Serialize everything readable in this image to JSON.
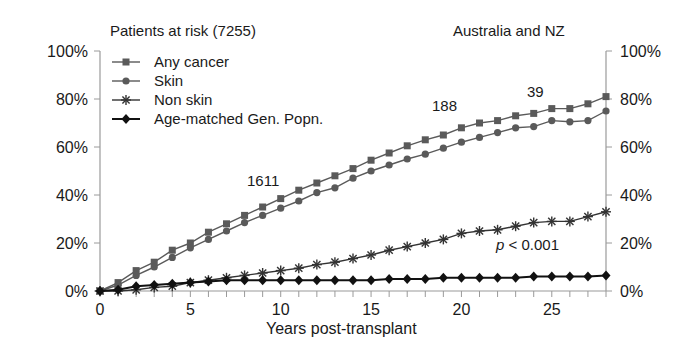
{
  "chart_data": {
    "type": "line",
    "title_left": "Patients at risk (7255)",
    "title_right": "Australia and NZ",
    "xlabel": "Years post-transplant",
    "ylabel": "",
    "xlim": [
      0,
      28
    ],
    "ylim": [
      0,
      100
    ],
    "x_ticks": [
      0,
      5,
      10,
      15,
      20,
      25
    ],
    "y_ticks": [
      "0%",
      "20%",
      "40%",
      "60%",
      "80%",
      "100%"
    ],
    "grid": false,
    "legend_position": "upper-left",
    "x": [
      0,
      1,
      2,
      3,
      4,
      5,
      6,
      7,
      8,
      9,
      10,
      11,
      12,
      13,
      14,
      15,
      16,
      17,
      18,
      19,
      20,
      21,
      22,
      23,
      24,
      25,
      26,
      27,
      28
    ],
    "series": [
      {
        "name": "Any cancer",
        "marker": "square",
        "color": "#5a5a5a",
        "values": [
          0,
          3.5,
          8.5,
          12,
          17,
          20,
          24.5,
          28,
          31.5,
          35,
          38.5,
          42,
          45,
          48,
          51,
          54.5,
          57.5,
          60.5,
          63,
          65,
          68,
          70,
          71,
          73,
          74,
          76,
          76,
          78,
          81
        ]
      },
      {
        "name": "Skin",
        "marker": "circle",
        "color": "#5a5a5a",
        "values": [
          0,
          2.5,
          6.5,
          10,
          14,
          18,
          21.5,
          25,
          28.5,
          31.5,
          34.5,
          37.5,
          41,
          43,
          47,
          50,
          52.5,
          55,
          57,
          59.5,
          62,
          64,
          66,
          68,
          68.5,
          71,
          70.5,
          71,
          75
        ]
      },
      {
        "name": "Non skin",
        "marker": "asterisk",
        "color": "#333333",
        "values": [
          0,
          0,
          0.5,
          1.5,
          2,
          3.5,
          4.5,
          5.5,
          6.5,
          7.5,
          8.5,
          9.5,
          11,
          12,
          13.5,
          15,
          17,
          18.5,
          20,
          21.5,
          24,
          25,
          25.5,
          27,
          28.5,
          29,
          29,
          31,
          33
        ]
      },
      {
        "name": "Age-matched Gen. Popn.",
        "marker": "diamond",
        "color": "#111111",
        "values": [
          0,
          0.5,
          2,
          2.5,
          3,
          3.5,
          4,
          4.5,
          4.5,
          4.5,
          4.5,
          4.5,
          4.5,
          4.5,
          4.5,
          4.5,
          5,
          5,
          5,
          5.5,
          5.5,
          5.5,
          5.5,
          5.5,
          6,
          6,
          6,
          6,
          6.5
        ]
      }
    ],
    "annotations": [
      {
        "text": "1611",
        "x": 9,
        "y": 42
      },
      {
        "text": "188",
        "x": 18.5,
        "y": 78
      },
      {
        "text": "39",
        "x": 23.7,
        "y": 84
      },
      {
        "text": "p < 0.001",
        "x": 24,
        "y": 18
      }
    ]
  },
  "labels": {
    "title_left": "Patients at risk (7255)",
    "title_right": "Australia and NZ",
    "xlabel": "Years post-transplant",
    "ann_1611": "1611",
    "ann_188": "188",
    "ann_39": "39",
    "p_italic": "p",
    "p_rest": " < 0.001"
  }
}
